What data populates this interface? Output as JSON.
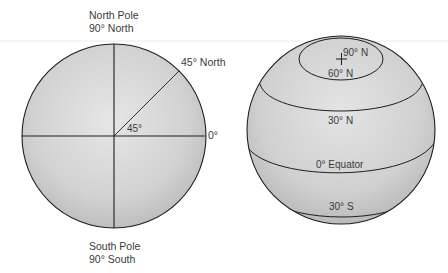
{
  "figure": {
    "left_diagram": {
      "title": "Cross-section of Earth showing latitude angles",
      "labels": {
        "north_pole_line1": "North Pole",
        "north_pole_line2": "90° North",
        "south_pole_line1": "South Pole",
        "south_pole_line2": "90° South",
        "lat_45": "45° North",
        "angle": "45°",
        "equator": "0°"
      }
    },
    "right_diagram": {
      "title": "Globe showing parallels of latitude",
      "labels": {
        "pole": "90° N",
        "lat_60": "60° N",
        "lat_30n": "30° N",
        "equator": "0° Equator",
        "lat_30s": "30° S"
      }
    }
  },
  "colors": {
    "sphere_fill_light": "#e2e2e2",
    "sphere_fill_dark": "#bdbdbd",
    "line": "#1e1e1e",
    "text": "#3a3a3a",
    "background": "#ffffff"
  }
}
